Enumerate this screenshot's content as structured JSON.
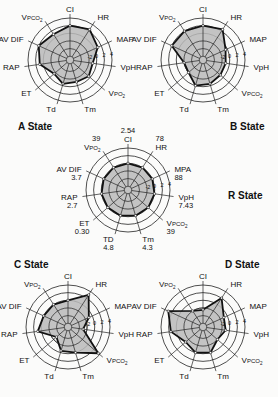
{
  "figure": {
    "scale_ticks": [
      "-2",
      "0",
      "2",
      "4"
    ]
  },
  "chart_data": [
    {
      "type": "radar",
      "title": "A State",
      "axes": [
        "CI",
        "HR",
        "MAP",
        "VpH",
        "VPO2",
        "Tm",
        "Td",
        "ET",
        "RAP",
        "AV DIF",
        "VPCO2"
      ],
      "values": [
        2,
        2.5,
        1,
        -1,
        -0.5,
        -1,
        -0.5,
        -1.5,
        1,
        2,
        1
      ],
      "scale": {
        "ticks": [
          -2,
          0,
          2,
          4
        ],
        "rings": [
          -6,
          -4,
          -2,
          0,
          2,
          4
        ]
      }
    },
    {
      "type": "radar",
      "title": "B State",
      "axes": [
        "CI",
        "HR",
        "MAP",
        "VpH",
        "VPCO2",
        "Tm",
        "Td",
        "ET",
        "RAP",
        "AV DIF",
        "VPO2"
      ],
      "values": [
        2,
        2.5,
        -0.5,
        -1,
        -1,
        -0.5,
        0,
        -2,
        -2,
        2,
        2
      ],
      "scale": {
        "ticks": [
          -2,
          0,
          2,
          4
        ],
        "rings": [
          -6,
          -4,
          -2,
          0,
          2,
          4
        ]
      }
    },
    {
      "type": "radar",
      "title": "R State",
      "axes": [
        "CI",
        "HR",
        "MPA",
        "VpH",
        "VPCO2",
        "Tm",
        "TD",
        "ET",
        "RAP",
        "AV DIF",
        "VPO2"
      ],
      "axis_values": [
        "2.54",
        "78",
        "88",
        "7.43",
        "39",
        "4.3",
        "4.8",
        "0.30",
        "2.7",
        "3.7",
        "39"
      ],
      "values": [
        0,
        0,
        0,
        0,
        0,
        0,
        0,
        0,
        0,
        0,
        0
      ],
      "scale": {
        "ticks": [
          -2,
          0,
          2,
          4
        ],
        "rings": [
          -6,
          -4,
          -2,
          0,
          2,
          4
        ]
      }
    },
    {
      "type": "radar",
      "title": "C State",
      "axes": [
        "CI",
        "HR",
        "MAP",
        "VpH",
        "VPCO2",
        "Tm",
        "Td",
        "ET",
        "RAP",
        "AV DIF",
        "VPO2"
      ],
      "values": [
        0,
        3,
        -1,
        -3,
        3.5,
        0,
        -0.5,
        -3,
        1,
        0,
        0
      ],
      "scale": {
        "ticks": [
          -2,
          0,
          2,
          4
        ],
        "rings": [
          -6,
          -4,
          -2,
          0,
          2,
          4
        ]
      }
    },
    {
      "type": "radar",
      "title": "D State",
      "axes": [
        "CI",
        "HR",
        "MAP",
        "VpH",
        "VPCO2",
        "Tm",
        "Td",
        "ET",
        "RAP",
        "AV DIF",
        "VPO2"
      ],
      "values": [
        -2.5,
        2,
        -1,
        -1,
        -2,
        0,
        0,
        -1,
        1.5,
        3,
        -2
      ],
      "scale": {
        "ticks": [
          -2,
          0,
          2,
          4
        ],
        "rings": [
          -6,
          -4,
          -2,
          0,
          2,
          4
        ]
      }
    }
  ],
  "layout": {
    "charts": [
      {
        "cx": 70,
        "cy": 60,
        "title_x": 18,
        "title_y": 130
      },
      {
        "cx": 203,
        "cy": 60,
        "title_x": 230,
        "title_y": 130
      },
      {
        "cx": 128,
        "cy": 190,
        "title_x": 228,
        "title_y": 199
      },
      {
        "cx": 68,
        "cy": 327,
        "title_x": 14,
        "title_y": 268
      },
      {
        "cx": 203,
        "cy": 327,
        "title_x": 225,
        "title_y": 268
      }
    ],
    "outer_radius": 42
  }
}
